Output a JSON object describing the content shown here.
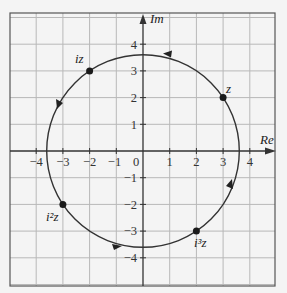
{
  "diagram": {
    "title": "",
    "axes": {
      "x_label": "Re",
      "y_label": "Im",
      "x_ticks": [
        "-4",
        "-3",
        "-2",
        "-1",
        "1",
        "2",
        "3",
        "4"
      ],
      "y_ticks": [
        "4",
        "3",
        "2",
        "1",
        "-1",
        "-2",
        "-3",
        "-4"
      ],
      "origin_label": "0",
      "range": [
        -5,
        5
      ]
    },
    "circle": {
      "center": [
        0,
        0
      ],
      "radius": 3.606,
      "direction": "counterclockwise"
    },
    "points": [
      {
        "label": "z",
        "re": 3,
        "im": 2
      },
      {
        "label": "iz",
        "re": -2,
        "im": 3
      },
      {
        "label": "i²z",
        "re": -3,
        "im": -2
      },
      {
        "label": "i³z",
        "re": 2,
        "im": -3
      }
    ],
    "colors": {
      "grid": "#b8b8b8",
      "frame": "#555555",
      "curve": "#333333",
      "background": "#f4f4f4"
    }
  }
}
